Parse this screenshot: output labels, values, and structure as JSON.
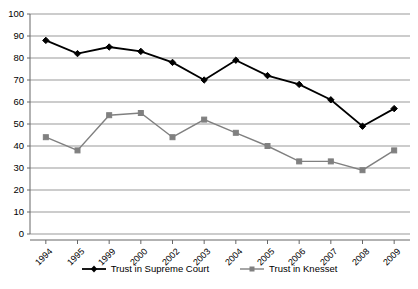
{
  "chart_data": {
    "type": "line",
    "title": "",
    "subtitle": "",
    "xlabel": "",
    "ylabel": "",
    "categories": [
      "1994",
      "1995",
      "1999",
      "2000",
      "2002",
      "2003",
      "2004",
      "2005",
      "2006",
      "2007",
      "2008",
      "2009"
    ],
    "series": [
      {
        "name": "Trust in Supreme Court",
        "marker": "diamond",
        "color": "#000000",
        "values": [
          88,
          82,
          85,
          83,
          78,
          70,
          79,
          72,
          68,
          61,
          49,
          57
        ]
      },
      {
        "name": "Trust in Knesset",
        "marker": "square",
        "color": "#808080",
        "values": [
          44,
          38,
          54,
          55,
          44,
          52,
          46,
          40,
          33,
          33,
          29,
          38
        ]
      }
    ],
    "ylim": [
      0,
      100
    ],
    "ytick_labels": [
      "0",
      "10",
      "20",
      "30",
      "40",
      "50",
      "60",
      "70",
      "80",
      "90",
      "100"
    ],
    "ytick_values": [
      0,
      10,
      20,
      30,
      40,
      50,
      60,
      70,
      80,
      90,
      100
    ],
    "grid": true,
    "grid_axis": "y",
    "grid_color": "#999999",
    "axis_color": "#666666",
    "legend_position": "bottom",
    "legend": [
      "Trust in Supreme Court",
      "Trust in Knesset"
    ]
  }
}
